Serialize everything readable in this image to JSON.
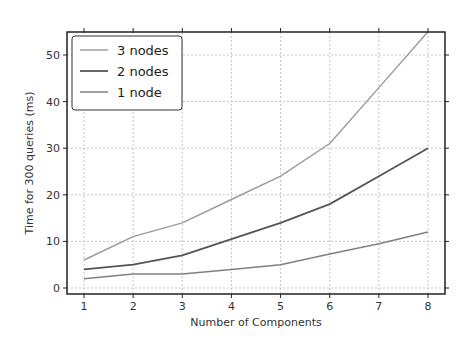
{
  "chart_data": {
    "type": "line",
    "title": "",
    "xlabel": "Number of Components",
    "ylabel": "Time for 300 queries (ms)",
    "x": [
      1,
      2,
      3,
      4,
      5,
      6,
      7,
      8
    ],
    "xlim": [
      0.8,
      8.2
    ],
    "ylim": [
      -1,
      58
    ],
    "xticks": [
      1,
      2,
      3,
      4,
      5,
      6,
      7,
      8
    ],
    "yticks": [
      0,
      10,
      20,
      30,
      40,
      50
    ],
    "grid": true,
    "legend_position": "upper left",
    "series": [
      {
        "name": "3 nodes",
        "color": "#9a9a9a",
        "width": 1.4,
        "values": [
          6,
          11,
          14,
          19,
          24,
          31,
          43,
          55
        ]
      },
      {
        "name": "2 nodes",
        "color": "#555555",
        "width": 1.8,
        "values": [
          4,
          5,
          7,
          10.5,
          14,
          18,
          24,
          30
        ]
      },
      {
        "name": "1 node",
        "color": "#808080",
        "width": 1.5,
        "values": [
          2,
          3,
          3,
          4,
          5,
          7.3,
          9.5,
          12
        ]
      }
    ]
  },
  "labels": {
    "xlabel": "Number of Components",
    "ylabel": "Time for 300 queries (ms)",
    "legend": [
      "3 nodes",
      "2 nodes",
      "1 node"
    ]
  }
}
